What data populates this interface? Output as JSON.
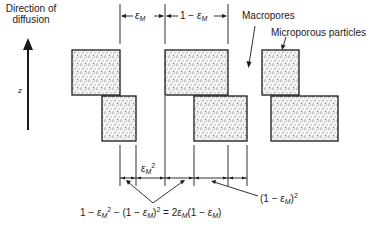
{
  "diagram": {
    "direction_label": [
      "Direction of",
      "diffusion"
    ],
    "axis_label": "z",
    "labels": {
      "macropores": "Macropores",
      "microporous_particles": "Microporous particles"
    },
    "dimensions": {
      "eps_symbol": "ε",
      "eps_subscript": "M",
      "top_left": {
        "prefix": "",
        "suffix": ""
      },
      "top_right": {
        "prefix": "1 − ",
        "suffix": ""
      },
      "bottom_left": {
        "exponent": "2"
      },
      "bottom_right": {
        "prefix": "(1 − ",
        "close": ")",
        "exponent": "2"
      }
    },
    "equation": {
      "p1": "1 − ",
      "p2": " − (1 − ",
      "p3": ") = 2",
      "p4": "(1 − ",
      "p5": ")",
      "exp": "2"
    },
    "colors": {
      "line": "#1a1a1a",
      "fill_base": "#f4f4f4",
      "dots": "#2a2a2a"
    },
    "blocks": [
      {
        "column": 1,
        "row": "upper"
      },
      {
        "column": 1,
        "row": "lower"
      },
      {
        "column": 2,
        "row": "upper"
      },
      {
        "column": 2,
        "row": "lower"
      },
      {
        "column": 3,
        "row": "upper"
      },
      {
        "column": 3,
        "row": "lower"
      }
    ]
  }
}
